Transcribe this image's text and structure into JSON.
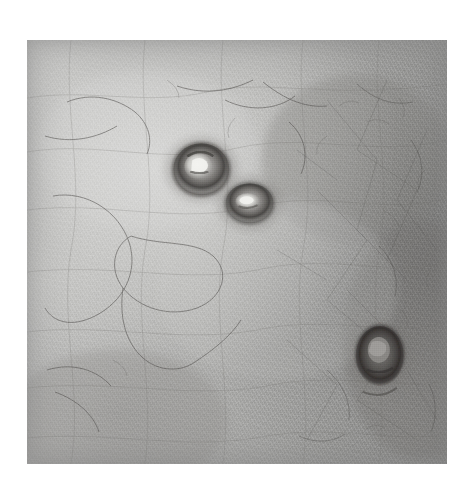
{
  "image": {
    "kind": "clinical-dermatology-photograph",
    "modality": "grayscale close-up photograph",
    "subject": "human skin surface with three umbilicated papules",
    "caption": "",
    "canvas": {
      "width": 473,
      "height": 482,
      "background_hex": "#ffffff"
    },
    "photo_frame": {
      "x": 27,
      "y": 40,
      "width": 420,
      "height": 424
    },
    "palette": {
      "background_hex": "#ffffff",
      "skin_light_hex": "#d0d0ce",
      "skin_mid_hex": "#b2b2b0",
      "skin_dark_hex": "#8a8a88",
      "lesion_rim_hex": "#4a4745",
      "lesion_core_hex": "#e8e8e4",
      "hair_hex": "#5a5856"
    },
    "lighting": {
      "description": "diffuse illumination brightest toward upper-left, falling off to the right edge",
      "bright_point": {
        "x_pct": 30,
        "y_pct": 30
      },
      "dark_region": {
        "x_pct": 96,
        "y_pct": 52
      }
    },
    "texture": {
      "description": "fine criss-cross skin lines (dermatoglyphics) with follicular speckle and scattered fine hairs"
    },
    "lesions": [
      {
        "label": "lesion-1",
        "description": "umbilicated papule with dark rim and bright central core",
        "cx_pct": 41.5,
        "cy_pct": 30.5,
        "rx_pct": 7.0,
        "ry_pct": 6.6,
        "rim_hex": "#4d4a48",
        "core_hex": "#ececea"
      },
      {
        "label": "lesion-2",
        "description": "smaller adjacent umbilicated papule, slit-like bright core",
        "cx_pct": 53.0,
        "cy_pct": 38.5,
        "rx_pct": 6.2,
        "ry_pct": 5.2,
        "rim_hex": "#52504d",
        "core_hex": "#e4e4e2"
      },
      {
        "label": "lesion-3",
        "description": "darker isolated papule in lower-right quadrant, dim core",
        "cx_pct": 84.0,
        "cy_pct": 74.5,
        "rx_pct": 6.0,
        "ry_pct": 7.2,
        "rim_hex": "#3f3d3b",
        "core_hex": "#8f8d8a"
      }
    ],
    "hairs": [
      {
        "label": "hair-long-left-loop"
      },
      {
        "label": "hair-left-arc"
      },
      {
        "label": "hair-top-center-arc"
      },
      {
        "label": "hair-top-right-fine"
      },
      {
        "label": "hair-right-cluster"
      },
      {
        "label": "hair-bottom-left-short"
      }
    ]
  }
}
